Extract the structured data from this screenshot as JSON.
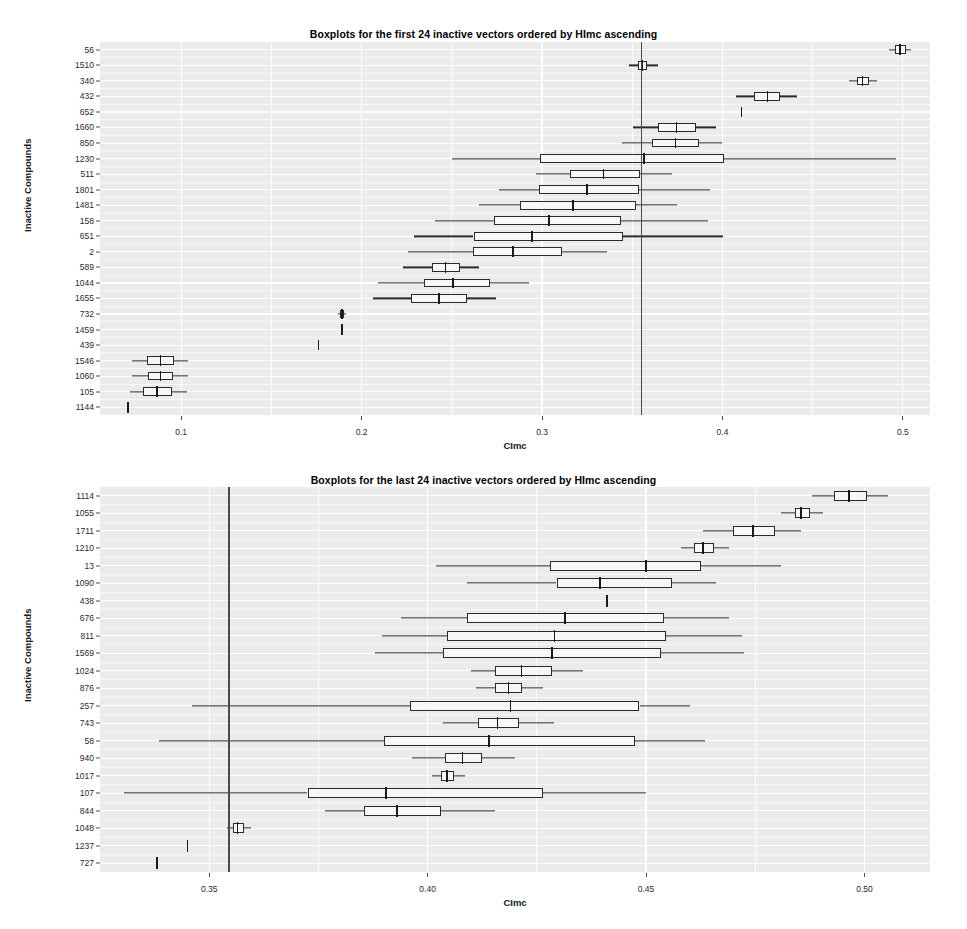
{
  "charts": [
    {
      "id": "chart-first-24",
      "title": "Boxplots for the first 24 inactive vectors ordered by HImc ascending",
      "chart_data": {
        "type": "boxplot",
        "title": "Boxplots for the first 24 inactive vectors ordered by HImc ascending",
        "xlabel": "CImc",
        "ylabel": "Inactive Compounds",
        "orientation": "horizontal",
        "grid": true,
        "legend": null,
        "xlim": [
          0.055,
          0.515
        ],
        "xticks": [
          0.1,
          0.2,
          0.3,
          0.4,
          0.5
        ],
        "xtick_labels": [
          "0.1",
          "0.2",
          "0.3",
          "0.4",
          "0.5"
        ],
        "reference_line": 0.355,
        "categories": [
          "56",
          "1510",
          "340",
          "432",
          "652",
          "1660",
          "850",
          "1230",
          "511",
          "1801",
          "1481",
          "158",
          "651",
          "2",
          "589",
          "1044",
          "1655",
          "732",
          "1459",
          "439",
          "1546",
          "1060",
          "105",
          "1144"
        ],
        "boxes": [
          {
            "category": "56",
            "whisker_low": 0.4925,
            "q1": 0.4955,
            "median": 0.4985,
            "q3": 0.5015,
            "whisker_high": 0.5045
          },
          {
            "category": "1510",
            "whisker_low": 0.348,
            "q1": 0.353,
            "median": 0.3555,
            "q3": 0.358,
            "whisker_high": 0.364
          },
          {
            "category": "340",
            "whisker_low": 0.47,
            "q1": 0.4745,
            "median": 0.4775,
            "q3": 0.481,
            "whisker_high": 0.4855
          },
          {
            "category": "432",
            "whisker_low": 0.4075,
            "q1": 0.4175,
            "median": 0.425,
            "q3": 0.432,
            "whisker_high": 0.4415
          },
          {
            "category": "652",
            "whisker_low": 0.4105,
            "q1": 0.4105,
            "median": 0.4105,
            "q3": 0.4105,
            "whisker_high": 0.4105
          },
          {
            "category": "1660",
            "whisker_low": 0.3505,
            "q1": 0.364,
            "median": 0.3745,
            "q3": 0.3855,
            "whisker_high": 0.3965
          },
          {
            "category": "850",
            "whisker_low": 0.3445,
            "q1": 0.361,
            "median": 0.374,
            "q3": 0.387,
            "whisker_high": 0.3995
          },
          {
            "category": "1230",
            "whisker_low": 0.25,
            "q1": 0.299,
            "median": 0.3565,
            "q3": 0.401,
            "whisker_high": 0.496
          },
          {
            "category": "511",
            "whisker_low": 0.2965,
            "q1": 0.3155,
            "median": 0.334,
            "q3": 0.3545,
            "whisker_high": 0.372
          },
          {
            "category": "1801",
            "whisker_low": 0.276,
            "q1": 0.2985,
            "median": 0.325,
            "q3": 0.3535,
            "whisker_high": 0.393
          },
          {
            "category": "1481",
            "whisker_low": 0.265,
            "q1": 0.288,
            "median": 0.317,
            "q3": 0.352,
            "whisker_high": 0.375
          },
          {
            "category": "158",
            "whisker_low": 0.2405,
            "q1": 0.2735,
            "median": 0.304,
            "q3": 0.344,
            "whisker_high": 0.392
          },
          {
            "category": "651",
            "whisker_low": 0.229,
            "q1": 0.262,
            "median": 0.2945,
            "q3": 0.345,
            "whisker_high": 0.4005
          },
          {
            "category": "2",
            "whisker_low": 0.2255,
            "q1": 0.2615,
            "median": 0.284,
            "q3": 0.311,
            "whisker_high": 0.336
          },
          {
            "category": "589",
            "whisker_low": 0.223,
            "q1": 0.239,
            "median": 0.2465,
            "q3": 0.2545,
            "whisker_high": 0.265
          },
          {
            "category": "1044",
            "whisker_low": 0.209,
            "q1": 0.2345,
            "median": 0.2505,
            "q3": 0.271,
            "whisker_high": 0.293
          },
          {
            "category": "1655",
            "whisker_low": 0.2065,
            "q1": 0.2275,
            "median": 0.243,
            "q3": 0.2585,
            "whisker_high": 0.2745
          },
          {
            "category": "732",
            "whisker_low": 0.187,
            "q1": 0.188,
            "median": 0.189,
            "q3": 0.19,
            "whisker_high": 0.1915
          },
          {
            "category": "1459",
            "whisker_low": 0.189,
            "q1": 0.189,
            "median": 0.189,
            "q3": 0.189,
            "whisker_high": 0.189
          },
          {
            "category": "439",
            "whisker_low": 0.176,
            "q1": 0.176,
            "median": 0.176,
            "q3": 0.176,
            "whisker_high": 0.176
          },
          {
            "category": "1546",
            "whisker_low": 0.073,
            "q1": 0.081,
            "median": 0.0885,
            "q3": 0.096,
            "whisker_high": 0.104
          },
          {
            "category": "1060",
            "whisker_low": 0.073,
            "q1": 0.0815,
            "median": 0.0885,
            "q3": 0.0955,
            "whisker_high": 0.104
          },
          {
            "category": "105",
            "whisker_low": 0.0715,
            "q1": 0.079,
            "median": 0.0865,
            "q3": 0.095,
            "whisker_high": 0.103
          },
          {
            "category": "1144",
            "whisker_low": 0.0705,
            "q1": 0.0705,
            "median": 0.0705,
            "q3": 0.0705,
            "whisker_high": 0.0705
          }
        ]
      }
    },
    {
      "id": "chart-last-24",
      "title": "Boxplots for the last 24 inactive vectors ordered by HImc ascending",
      "chart_data": {
        "type": "boxplot",
        "title": "Boxplots for the last 24 inactive vectors ordered by HImc ascending",
        "xlabel": "CImc",
        "ylabel": "Inactive Compounds",
        "orientation": "horizontal",
        "grid": true,
        "legend": null,
        "xlim": [
          0.325,
          0.515
        ],
        "xticks": [
          0.35,
          0.4,
          0.45,
          0.5
        ],
        "xtick_labels": [
          "0.35",
          "0.40",
          "0.45",
          "0.50"
        ],
        "reference_line": 0.3545,
        "categories": [
          "1114",
          "1055",
          "1711",
          "1210",
          "13",
          "1090",
          "438",
          "676",
          "811",
          "1569",
          "1024",
          "876",
          "257",
          "743",
          "58",
          "940",
          "1017",
          "107",
          "844",
          "1048",
          "1237",
          "727"
        ],
        "boxes": [
          {
            "category": "1114",
            "whisker_low": 0.488,
            "q1": 0.493,
            "median": 0.4965,
            "q3": 0.5005,
            "whisker_high": 0.5055
          },
          {
            "category": "1055",
            "whisker_low": 0.481,
            "q1": 0.484,
            "median": 0.4855,
            "q3": 0.4875,
            "whisker_high": 0.4905
          },
          {
            "category": "1711",
            "whisker_low": 0.463,
            "q1": 0.47,
            "median": 0.4745,
            "q3": 0.4795,
            "whisker_high": 0.4855
          },
          {
            "category": "1210",
            "whisker_low": 0.458,
            "q1": 0.461,
            "median": 0.463,
            "q3": 0.4655,
            "whisker_high": 0.469
          },
          {
            "category": "13",
            "whisker_low": 0.402,
            "q1": 0.428,
            "median": 0.45,
            "q3": 0.4625,
            "whisker_high": 0.481
          },
          {
            "category": "1090",
            "whisker_low": 0.409,
            "q1": 0.4295,
            "median": 0.4395,
            "q3": 0.456,
            "whisker_high": 0.466
          },
          {
            "category": "438",
            "whisker_low": 0.441,
            "q1": 0.441,
            "median": 0.441,
            "q3": 0.441,
            "whisker_high": 0.441
          },
          {
            "category": "676",
            "whisker_low": 0.394,
            "q1": 0.409,
            "median": 0.4315,
            "q3": 0.454,
            "whisker_high": 0.469
          },
          {
            "category": "811",
            "whisker_low": 0.3895,
            "q1": 0.4045,
            "median": 0.429,
            "q3": 0.4545,
            "whisker_high": 0.472
          },
          {
            "category": "1569",
            "whisker_low": 0.388,
            "q1": 0.4035,
            "median": 0.4285,
            "q3": 0.4535,
            "whisker_high": 0.4725
          },
          {
            "category": "1024",
            "whisker_low": 0.41,
            "q1": 0.4155,
            "median": 0.4215,
            "q3": 0.4285,
            "whisker_high": 0.4355
          },
          {
            "category": "876",
            "whisker_low": 0.411,
            "q1": 0.4155,
            "median": 0.4185,
            "q3": 0.4215,
            "whisker_high": 0.4265
          },
          {
            "category": "257",
            "whisker_low": 0.346,
            "q1": 0.396,
            "median": 0.419,
            "q3": 0.4485,
            "whisker_high": 0.46
          },
          {
            "category": "743",
            "whisker_low": 0.4035,
            "q1": 0.4115,
            "median": 0.416,
            "q3": 0.421,
            "whisker_high": 0.429
          },
          {
            "category": "58",
            "whisker_low": 0.3385,
            "q1": 0.39,
            "median": 0.414,
            "q3": 0.4475,
            "whisker_high": 0.4635
          },
          {
            "category": "940",
            "whisker_low": 0.3965,
            "q1": 0.404,
            "median": 0.408,
            "q3": 0.4125,
            "whisker_high": 0.42
          },
          {
            "category": "1017",
            "whisker_low": 0.401,
            "q1": 0.403,
            "median": 0.4045,
            "q3": 0.406,
            "whisker_high": 0.4085
          },
          {
            "category": "107",
            "whisker_low": 0.3305,
            "q1": 0.3725,
            "median": 0.3905,
            "q3": 0.4265,
            "whisker_high": 0.45
          },
          {
            "category": "844",
            "whisker_low": 0.3765,
            "q1": 0.3855,
            "median": 0.393,
            "q3": 0.403,
            "whisker_high": 0.4155
          },
          {
            "category": "1048",
            "whisker_low": 0.354,
            "q1": 0.3555,
            "median": 0.3565,
            "q3": 0.358,
            "whisker_high": 0.3595
          },
          {
            "category": "1237",
            "whisker_low": 0.345,
            "q1": 0.345,
            "median": 0.345,
            "q3": 0.345,
            "whisker_high": 0.345
          },
          {
            "category": "727",
            "whisker_low": 0.338,
            "q1": 0.338,
            "median": 0.338,
            "q3": 0.338,
            "whisker_high": 0.338
          }
        ]
      }
    }
  ],
  "colors": {
    "panel_background": "#ebebeb",
    "gridline": "#ffffff",
    "box_stroke": "#2b2b2b",
    "box_fill": "#f7f7f7",
    "reference_line": "#4a4a4a",
    "text": "#000000"
  }
}
